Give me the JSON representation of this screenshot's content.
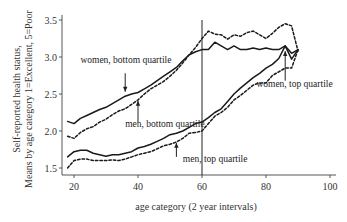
{
  "chart_data": {
    "type": "line",
    "title": "",
    "xlabel": "age category (2 year intervals)",
    "ylabel_lines": [
      "Self-reported health status,",
      "Means by age category 1=Excellent, 5=Poor"
    ],
    "xlim": [
      17,
      103
    ],
    "ylim": [
      1.45,
      3.55
    ],
    "xticks": [
      20,
      40,
      60,
      80,
      100
    ],
    "yticks": [
      1.5,
      2.0,
      2.5,
      3.0,
      3.5
    ],
    "ytick_labels": [
      "1.5",
      "2.0",
      "2.5",
      "3.0",
      "3.5"
    ],
    "grid": false,
    "legend": "none (inline annotations)",
    "vertical_reference_line_x": 60,
    "series": [
      {
        "name": "women, bottom quartile",
        "style": "solid",
        "x": [
          18,
          20,
          22,
          24,
          26,
          28,
          30,
          32,
          34,
          36,
          38,
          40,
          42,
          44,
          46,
          48,
          50,
          52,
          54,
          56,
          58,
          60,
          62,
          64,
          66,
          68,
          70,
          72,
          74,
          76,
          78,
          80,
          82,
          84,
          86,
          88,
          90
        ],
        "values": [
          2.13,
          2.1,
          2.17,
          2.21,
          2.25,
          2.29,
          2.32,
          2.37,
          2.42,
          2.47,
          2.5,
          2.52,
          2.57,
          2.62,
          2.68,
          2.74,
          2.8,
          2.86,
          2.95,
          3.03,
          3.07,
          3.1,
          3.1,
          3.2,
          3.15,
          3.1,
          3.15,
          3.1,
          3.1,
          3.12,
          3.1,
          3.12,
          3.1,
          3.1,
          3.15,
          3.05,
          3.1
        ]
      },
      {
        "name": "men, bottom quartile",
        "style": "dashed",
        "x": [
          18,
          20,
          22,
          24,
          26,
          28,
          30,
          32,
          34,
          36,
          38,
          40,
          42,
          44,
          46,
          48,
          50,
          52,
          54,
          56,
          58,
          60,
          62,
          64,
          66,
          68,
          70,
          72,
          74,
          76,
          78,
          80,
          82,
          84,
          86,
          88,
          90
        ],
        "values": [
          1.93,
          1.9,
          1.98,
          2.03,
          2.06,
          2.12,
          2.16,
          2.22,
          2.27,
          2.3,
          2.36,
          2.42,
          2.5,
          2.57,
          2.62,
          2.67,
          2.74,
          2.82,
          2.92,
          3.03,
          3.13,
          3.25,
          3.35,
          3.31,
          3.3,
          3.24,
          3.3,
          3.28,
          3.33,
          3.35,
          3.3,
          3.25,
          3.32,
          3.4,
          3.45,
          3.42,
          3.08
        ]
      },
      {
        "name": "women, top quartile",
        "style": "solid",
        "x": [
          18,
          20,
          22,
          24,
          26,
          28,
          30,
          32,
          34,
          36,
          38,
          40,
          42,
          44,
          46,
          48,
          50,
          52,
          54,
          56,
          58,
          60,
          62,
          64,
          66,
          68,
          70,
          72,
          74,
          76,
          78,
          80,
          82,
          84,
          86,
          88,
          90
        ],
        "values": [
          1.65,
          1.72,
          1.74,
          1.74,
          1.7,
          1.68,
          1.66,
          1.68,
          1.68,
          1.7,
          1.72,
          1.77,
          1.79,
          1.82,
          1.86,
          1.9,
          1.95,
          1.97,
          2.0,
          2.05,
          2.1,
          2.12,
          2.18,
          2.25,
          2.3,
          2.4,
          2.5,
          2.58,
          2.65,
          2.72,
          2.78,
          2.85,
          2.9,
          2.98,
          3.15,
          2.97,
          3.1
        ]
      },
      {
        "name": "men, top quartile",
        "style": "dashed",
        "x": [
          18,
          20,
          22,
          24,
          26,
          28,
          30,
          32,
          34,
          36,
          38,
          40,
          42,
          44,
          46,
          48,
          50,
          52,
          54,
          56,
          58,
          60,
          62,
          64,
          66,
          68,
          70,
          72,
          74,
          76,
          78,
          80,
          82,
          84,
          86,
          88,
          90
        ],
        "values": [
          1.5,
          1.6,
          1.62,
          1.62,
          1.6,
          1.6,
          1.6,
          1.61,
          1.6,
          1.62,
          1.65,
          1.68,
          1.7,
          1.72,
          1.76,
          1.8,
          1.82,
          1.85,
          1.9,
          1.97,
          1.98,
          2.0,
          2.1,
          2.2,
          2.25,
          2.32,
          2.42,
          2.48,
          2.55,
          2.62,
          2.65,
          2.65,
          2.75,
          2.8,
          2.85,
          2.85,
          3.1
        ]
      }
    ],
    "annotations": [
      {
        "text": "women, bottom quartile",
        "text_x": 22,
        "text_y": 2.92,
        "arrow_from": [
          36,
          2.78
        ],
        "arrow_to": [
          36,
          2.53
        ]
      },
      {
        "text": "men, bottom quartile",
        "text_x": 36,
        "text_y": 2.06,
        "arrow_from": [
          40,
          2.12
        ],
        "arrow_to": [
          40,
          2.41
        ]
      },
      {
        "text": "men, top quartile",
        "text_x": 54,
        "text_y": 1.58,
        "arrow_from": [
          52,
          1.65
        ],
        "arrow_to": [
          52,
          1.84
        ]
      },
      {
        "text": "women, top quartile",
        "text_x": 77,
        "text_y": 2.6,
        "arrow_from": [
          86,
          2.68
        ],
        "arrow_to": [
          86,
          3.08
        ]
      }
    ]
  }
}
